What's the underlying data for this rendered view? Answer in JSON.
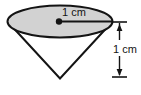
{
  "figure": {
    "type": "geometry-diagram",
    "shape": "cone",
    "orientation": "apex-down",
    "background_color": "#ffffff",
    "base": {
      "name": "circular-base",
      "rendered_as": "ellipse",
      "fill_color": "#d2d2d2",
      "stroke_color": "#141414",
      "center_marker": "center-dot"
    },
    "stroke_color": "#141414",
    "labels": {
      "radius": "1 cm",
      "height": "1 cm"
    },
    "dimensions": [
      {
        "name": "radius",
        "value": "1 cm",
        "direction": "horizontal",
        "measures": "base radius"
      },
      {
        "name": "height",
        "value": "1 cm",
        "direction": "vertical",
        "measures": "cone height"
      }
    ]
  }
}
